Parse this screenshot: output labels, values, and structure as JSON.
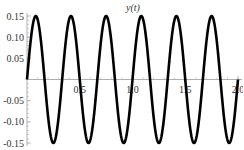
{
  "chart_data": {
    "type": "line",
    "title": "y(t)",
    "xlabel": "",
    "ylabel": "",
    "xlim": [
      0,
      2.0
    ],
    "ylim": [
      -0.15,
      0.15
    ],
    "x_ticks": [
      "0.5",
      "1.0",
      "1.5",
      "2.0"
    ],
    "x_tick_values": [
      0.5,
      1.0,
      1.5,
      2.0
    ],
    "y_ticks": [
      "0.15",
      "0.10",
      "0.05",
      "-0.05",
      "-0.10",
      "-0.15"
    ],
    "y_tick_values": [
      0.15,
      0.1,
      0.05,
      -0.05,
      -0.1,
      -0.15
    ],
    "grid": false,
    "legend": null,
    "series": [
      {
        "name": "y(t)",
        "function": "0.15*sin(6*pi*t)",
        "amplitude": 0.15,
        "frequency": 3,
        "x": [
          0,
          0.0833,
          0.1667,
          0.25,
          0.3333,
          0.4167,
          0.5,
          0.5833,
          0.6667,
          0.75,
          0.8333,
          0.9167,
          1.0,
          1.0833,
          1.1667,
          1.25,
          1.3333,
          1.4167,
          1.5,
          1.5833,
          1.6667,
          1.75,
          1.8333,
          1.9167,
          2.0
        ],
        "values": [
          0,
          0.15,
          0,
          -0.15,
          0,
          0.15,
          0,
          -0.15,
          0,
          0.15,
          0,
          -0.15,
          0,
          0.15,
          0,
          -0.15,
          0,
          0.15,
          0,
          -0.15,
          0,
          0.15,
          0,
          -0.15,
          0
        ],
        "color": "#000000"
      }
    ]
  },
  "colors": {
    "line": "#000000",
    "axis": "#b0b0b0",
    "text": "#333333"
  }
}
